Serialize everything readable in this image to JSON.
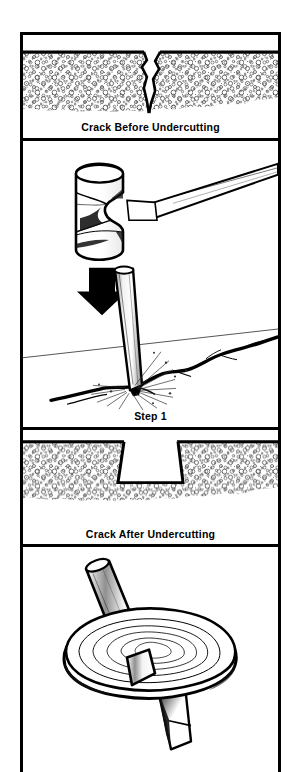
{
  "figure": {
    "panels": [
      {
        "id": "crack-before",
        "caption": "Crack Before Undercutting",
        "subject": "concrete-section-with-v-crack",
        "elements": [
          "concrete-surface-line",
          "aggregate-texture",
          "jagged-v-crack"
        ]
      },
      {
        "id": "step-1",
        "caption": "Step 1",
        "subject": "hammer-striking-chisel-into-crack",
        "elements": [
          "sledge-hammer",
          "downward-arrow",
          "cold-chisel",
          "impact-sparks",
          "pavement-crack-line",
          "horizon-line"
        ]
      },
      {
        "id": "crack-after",
        "caption": "Crack After Undercutting",
        "subject": "concrete-section-with-dovetail-groove",
        "elements": [
          "concrete-surface-line",
          "aggregate-texture",
          "undercut-dovetail-groove"
        ]
      },
      {
        "id": "grinding-wheel",
        "caption": "",
        "subject": "grinding-wheel-on-shaft-with-cutting-bit",
        "elements": [
          "shaft",
          "abrasive-disc",
          "cutting-bit"
        ]
      }
    ]
  },
  "colors": {
    "ink": "#000000",
    "paper": "#ffffff",
    "aggregate": "#555555",
    "shade": "#9a9a9a",
    "light_shade": "#d8d8d8"
  }
}
